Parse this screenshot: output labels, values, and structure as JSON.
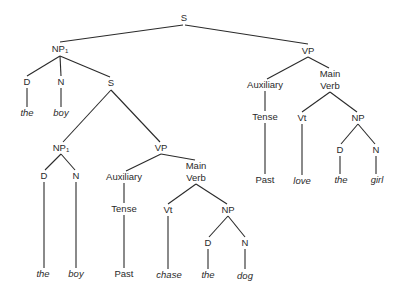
{
  "diagram": {
    "type": "syntax-tree",
    "sentence": "the boy the boy chase the dog love the girl",
    "nodes": [
      {
        "id": "s0",
        "label": "S",
        "sub": "",
        "x": 184,
        "y": 18,
        "leaf": false
      },
      {
        "id": "np1a",
        "label": "NP",
        "sub": "1",
        "x": 60,
        "y": 49,
        "leaf": false
      },
      {
        "id": "d1",
        "label": "D",
        "sub": "",
        "x": 27,
        "y": 82,
        "leaf": false
      },
      {
        "id": "n1",
        "label": "N",
        "sub": "",
        "x": 61,
        "y": 82,
        "leaf": false
      },
      {
        "id": "s1",
        "label": "S",
        "sub": "",
        "x": 111,
        "y": 83,
        "leaf": false
      },
      {
        "id": "the1",
        "label": "the",
        "sub": "",
        "x": 27,
        "y": 113,
        "leaf": true
      },
      {
        "id": "boy1",
        "label": "boy",
        "sub": "",
        "x": 61,
        "y": 113,
        "leaf": true
      },
      {
        "id": "np1b",
        "label": "NP",
        "sub": "1",
        "x": 61,
        "y": 148,
        "leaf": false
      },
      {
        "id": "vp1",
        "label": "VP",
        "sub": "",
        "x": 161,
        "y": 148,
        "leaf": false
      },
      {
        "id": "d2",
        "label": "D",
        "sub": "",
        "x": 44,
        "y": 176,
        "leaf": false
      },
      {
        "id": "n2",
        "label": "N",
        "sub": "",
        "x": 76,
        "y": 176,
        "leaf": false
      },
      {
        "id": "the2",
        "label": "the",
        "sub": "",
        "x": 43,
        "y": 274,
        "leaf": true
      },
      {
        "id": "boy2",
        "label": "boy",
        "sub": "",
        "x": 76,
        "y": 274,
        "leaf": true
      },
      {
        "id": "aux1",
        "label": "Auxiliary",
        "sub": "",
        "x": 124,
        "y": 177,
        "leaf": false
      },
      {
        "id": "mv1a",
        "label": "Main",
        "sub": "",
        "x": 196,
        "y": 166,
        "leaf": false
      },
      {
        "id": "mv1b",
        "label": "Verb",
        "sub": "",
        "x": 196,
        "y": 178,
        "leaf": false
      },
      {
        "id": "tense1",
        "label": "Tense",
        "sub": "",
        "x": 124,
        "y": 209,
        "leaf": false
      },
      {
        "id": "past1",
        "label": "Past",
        "sub": "",
        "x": 124,
        "y": 274,
        "leaf": false
      },
      {
        "id": "vt1",
        "label": "Vt",
        "sub": "",
        "x": 168,
        "y": 210,
        "leaf": false
      },
      {
        "id": "chase",
        "label": "chase",
        "sub": "",
        "x": 169,
        "y": 275,
        "leaf": true
      },
      {
        "id": "np2",
        "label": "NP",
        "sub": "",
        "x": 228,
        "y": 210,
        "leaf": false
      },
      {
        "id": "d3",
        "label": "D",
        "sub": "",
        "x": 208,
        "y": 243,
        "leaf": false
      },
      {
        "id": "n3",
        "label": "N",
        "sub": "",
        "x": 245,
        "y": 243,
        "leaf": false
      },
      {
        "id": "the3",
        "label": "the",
        "sub": "",
        "x": 208,
        "y": 275,
        "leaf": true
      },
      {
        "id": "dog",
        "label": "dog",
        "sub": "",
        "x": 245,
        "y": 276,
        "leaf": true
      },
      {
        "id": "vp0",
        "label": "VP",
        "sub": "",
        "x": 308,
        "y": 51,
        "leaf": false
      },
      {
        "id": "aux0",
        "label": "Auxiliary",
        "sub": "",
        "x": 265,
        "y": 85,
        "leaf": false
      },
      {
        "id": "mv0a",
        "label": "Main",
        "sub": "",
        "x": 330,
        "y": 74,
        "leaf": false
      },
      {
        "id": "mv0b",
        "label": "Verb",
        "sub": "",
        "x": 330,
        "y": 86,
        "leaf": false
      },
      {
        "id": "tense0",
        "label": "Tense",
        "sub": "",
        "x": 265,
        "y": 117,
        "leaf": false
      },
      {
        "id": "past0",
        "label": "Past",
        "sub": "",
        "x": 265,
        "y": 180,
        "leaf": false
      },
      {
        "id": "vt0",
        "label": "Vt",
        "sub": "",
        "x": 302,
        "y": 118,
        "leaf": false
      },
      {
        "id": "love",
        "label": "love",
        "sub": "",
        "x": 302,
        "y": 181,
        "leaf": true
      },
      {
        "id": "np3",
        "label": "NP",
        "sub": "",
        "x": 358,
        "y": 118,
        "leaf": false
      },
      {
        "id": "d4",
        "label": "D",
        "sub": "",
        "x": 340,
        "y": 150,
        "leaf": false
      },
      {
        "id": "n4",
        "label": "N",
        "sub": "",
        "x": 376,
        "y": 150,
        "leaf": false
      },
      {
        "id": "the4",
        "label": "the",
        "sub": "",
        "x": 341,
        "y": 180,
        "leaf": true
      },
      {
        "id": "girl",
        "label": "girl",
        "sub": "",
        "x": 377,
        "y": 180,
        "leaf": true
      }
    ],
    "edges": [
      [
        183,
        25,
        60,
        42
      ],
      [
        185,
        25,
        308,
        44
      ],
      [
        60,
        56,
        27,
        76
      ],
      [
        60,
        56,
        61,
        76
      ],
      [
        60,
        56,
        110,
        77
      ],
      [
        27,
        88,
        27,
        107
      ],
      [
        61,
        88,
        61,
        107
      ],
      [
        111,
        90,
        63,
        142
      ],
      [
        111,
        90,
        160,
        142
      ],
      [
        61,
        154,
        45,
        170
      ],
      [
        61,
        154,
        75,
        170
      ],
      [
        44,
        182,
        44,
        268
      ],
      [
        76,
        182,
        76,
        268
      ],
      [
        161,
        154,
        126,
        171
      ],
      [
        161,
        154,
        195,
        160
      ],
      [
        124,
        183,
        124,
        203
      ],
      [
        124,
        215,
        124,
        268
      ],
      [
        196,
        184,
        168,
        204
      ],
      [
        196,
        184,
        227,
        204
      ],
      [
        168,
        216,
        168,
        269
      ],
      [
        228,
        216,
        209,
        237
      ],
      [
        228,
        216,
        245,
        237
      ],
      [
        208,
        249,
        208,
        269
      ],
      [
        245,
        249,
        245,
        269
      ],
      [
        308,
        57,
        267,
        79
      ],
      [
        308,
        57,
        329,
        68
      ],
      [
        265,
        91,
        265,
        111
      ],
      [
        265,
        123,
        265,
        174
      ],
      [
        330,
        92,
        302,
        112
      ],
      [
        330,
        92,
        357,
        112
      ],
      [
        302,
        124,
        302,
        175
      ],
      [
        358,
        124,
        341,
        144
      ],
      [
        358,
        124,
        375,
        144
      ],
      [
        340,
        156,
        340,
        174
      ],
      [
        376,
        156,
        376,
        174
      ]
    ]
  }
}
